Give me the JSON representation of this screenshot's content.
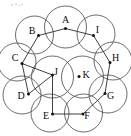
{
  "figure": {
    "width": 131,
    "height": 136,
    "background_color": "#ffffff",
    "circle_stroke_color": "#5a5a5a",
    "edge_stroke_color": "#2b2b2b",
    "dot_color": "#111111",
    "label_color": "#0d0d0d"
  },
  "nodes": [
    {
      "id": "A",
      "label": "A",
      "cx": 65.5,
      "cy": 27.0,
      "r": 21.0,
      "dot_x": 65.5,
      "dot_y": 28.5,
      "label_x": 65.5,
      "label_y": 21.0
    },
    {
      "id": "B",
      "label": "B",
      "cx": 34.5,
      "cy": 35.0,
      "r": 19.0,
      "dot_x": 38.5,
      "dot_y": 35.5,
      "label_x": 32.0,
      "label_y": 32.0
    },
    {
      "id": "C",
      "label": "C",
      "cx": 17.0,
      "cy": 62.0,
      "r": 19.0,
      "dot_x": 22.0,
      "dot_y": 63.5,
      "label_x": 15.0,
      "label_y": 59.0
    },
    {
      "id": "D",
      "label": "D",
      "cx": 22.0,
      "cy": 95.0,
      "r": 19.0,
      "dot_x": 28.5,
      "dot_y": 94.0,
      "label_x": 21.0,
      "label_y": 97.0
    },
    {
      "id": "E",
      "label": "E",
      "cx": 50.0,
      "cy": 113.0,
      "r": 19.0,
      "dot_x": 52.5,
      "dot_y": 114.0,
      "label_x": 46.0,
      "label_y": 117.0
    },
    {
      "id": "F",
      "label": "F",
      "cx": 83.5,
      "cy": 113.0,
      "r": 19.0,
      "dot_x": 83.0,
      "dot_y": 114.0,
      "label_x": 87.0,
      "label_y": 117.0
    },
    {
      "id": "G",
      "label": "G",
      "cx": 108.0,
      "cy": 94.0,
      "r": 19.0,
      "dot_x": 105.0,
      "dot_y": 93.5,
      "label_x": 110.5,
      "label_y": 97.0
    },
    {
      "id": "H",
      "label": "H",
      "cx": 113.0,
      "cy": 61.0,
      "r": 19.0,
      "dot_x": 110.0,
      "dot_y": 62.5,
      "label_x": 115.5,
      "label_y": 58.5
    },
    {
      "id": "I",
      "label": "I",
      "cx": 96.0,
      "cy": 34.0,
      "r": 19.0,
      "dot_x": 93.5,
      "dot_y": 35.5,
      "label_x": 97.5,
      "label_y": 31.0
    },
    {
      "id": "J",
      "label": "J",
      "cx": 52.5,
      "cy": 77.0,
      "r": 21.0,
      "dot_x": 52.5,
      "dot_y": 75.0,
      "label_x": 56.0,
      "label_y": 73.0
    },
    {
      "id": "K",
      "label": "K",
      "cx": 82.5,
      "cy": 77.0,
      "r": 21.0,
      "dot_x": 79.0,
      "dot_y": 76.5,
      "label_x": 86.0,
      "label_y": 76.0
    }
  ],
  "edges": [
    {
      "from": "A",
      "to": "B"
    },
    {
      "from": "A",
      "to": "I"
    },
    {
      "from": "B",
      "to": "C"
    },
    {
      "from": "C",
      "to": "D"
    },
    {
      "from": "C",
      "to": "J"
    },
    {
      "from": "D",
      "to": "J"
    },
    {
      "from": "J",
      "to": "E"
    },
    {
      "from": "E",
      "to": "F"
    },
    {
      "from": "F",
      "to": "G"
    },
    {
      "from": "G",
      "to": "H"
    },
    {
      "from": "H",
      "to": "I"
    }
  ],
  "specks": [
    {
      "x": 12.0,
      "y": 5.0,
      "r": 0.8
    },
    {
      "x": 16.0,
      "y": 4.0,
      "r": 0.7
    },
    {
      "x": 19.0,
      "y": 5.5,
      "r": 0.6
    },
    {
      "x": 22.0,
      "y": 4.5,
      "r": 0.7
    }
  ]
}
